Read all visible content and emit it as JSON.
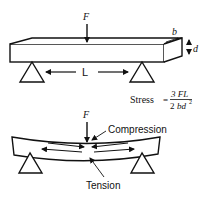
{
  "top_diagram": {
    "force_label": "F",
    "width_label": "b",
    "depth_label": "d",
    "span_label": "L",
    "formula": {
      "prefix": "Stress",
      "equals": "=",
      "numerator": "3 FL",
      "denominator_coef": "2",
      "denominator_var": "bd",
      "denominator_exp": "2"
    }
  },
  "bottom_diagram": {
    "force_label": "F",
    "compression_label": "Compression",
    "tension_label": "Tension"
  },
  "colors": {
    "ink": "#111111",
    "background": "#ffffff"
  }
}
